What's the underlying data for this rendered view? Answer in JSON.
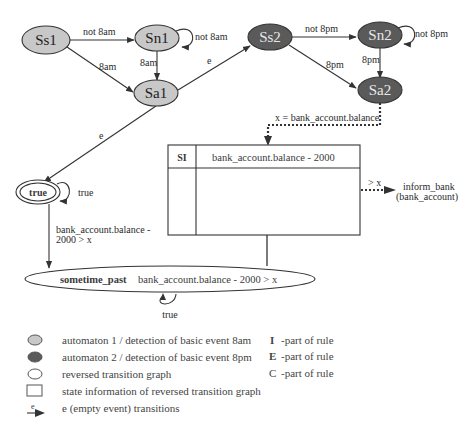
{
  "colors": {
    "automaton1_fill": "#c8c8c8",
    "automaton2_fill": "#5a5a5a",
    "reversed_fill": "#ffffff",
    "stroke": "#333333"
  },
  "automaton1": {
    "nodes": {
      "ss1": "Ss1",
      "sn1": "Sn1",
      "sa1": "Sa1"
    },
    "edges": {
      "ss1_sn1": "not 8am",
      "sn1_self": "not 8am",
      "ss1_sa1": "8am",
      "sn1_sa1": "8am"
    }
  },
  "automaton2": {
    "nodes": {
      "ss2": "Ss2",
      "sn2": "Sn2",
      "sa2": "Sa2"
    },
    "edges": {
      "ss2_sn2": "not 8pm",
      "sn2_self": "not 8pm",
      "ss2_sa2": "8pm",
      "sn2_sa2": "8pm"
    }
  },
  "epsilon_edges": {
    "sa1_ss2": "e",
    "sa1_true": "e"
  },
  "reversed_graph": {
    "true_node": "true",
    "true_self": "true",
    "true_to_past": "bank_account.balance -",
    "true_to_past_line2": "2000 > x",
    "past_node_name": "sometime_past",
    "past_node_condition": "bank_account.balance - 2000 > x",
    "past_self": "true"
  },
  "state_info": {
    "assignment": "x = bank_account.balance",
    "header_label": "SI",
    "header_value": "bank_account.balance - 2000",
    "action_condition": "> x",
    "action_line1": "inform_bank",
    "action_line2": "(bank_account)"
  },
  "legend": {
    "items": [
      "automaton 1 / detection of basic event 8am",
      "automaton 2 / detection of basic event 8pm",
      "reversed transition graph",
      "state information of reversed transition graph",
      "e (empty event) transitions"
    ],
    "epsilon_symbol": "e",
    "rule_parts": [
      {
        "letter": "I",
        "text": "-part of rule"
      },
      {
        "letter": "E",
        "text": "-part of rule"
      },
      {
        "letter": "C",
        "text": "-part of rule"
      }
    ]
  }
}
